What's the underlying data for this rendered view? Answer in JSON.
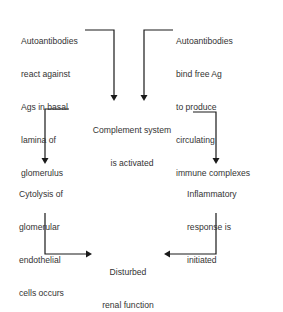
{
  "diagram": {
    "type": "flowchart",
    "nodes": {
      "autoantibodies_basal": {
        "lines": [
          "Autoantibodies",
          "react against",
          "Ags in basal",
          "lamina of",
          "glomerulus"
        ]
      },
      "autoantibodies_free": {
        "lines": [
          "Autoantibodies",
          "bind free Ag",
          "to produce",
          "circulating",
          "immune complexes"
        ]
      },
      "complement": {
        "lines": [
          "Complement system",
          "is activated"
        ]
      },
      "cytolysis": {
        "lines": [
          "Cytolysis of",
          "glomerular",
          "endothelial",
          "cells occurs"
        ]
      },
      "inflammatory": {
        "lines": [
          "Inflammatory",
          "response is",
          "initiated"
        ]
      },
      "disturbed": {
        "lines": [
          "Disturbed",
          "renal function"
        ]
      }
    },
    "edges": [
      {
        "from": "autoantibodies_basal",
        "to": "complement"
      },
      {
        "from": "autoantibodies_free",
        "to": "complement"
      },
      {
        "from": "complement",
        "to": "cytolysis"
      },
      {
        "from": "complement",
        "to": "inflammatory"
      },
      {
        "from": "cytolysis",
        "to": "disturbed"
      },
      {
        "from": "inflammatory",
        "to": "disturbed"
      }
    ],
    "colors": {
      "line": "#1a1a1a",
      "text": "#333333",
      "background": "#ffffff"
    }
  }
}
